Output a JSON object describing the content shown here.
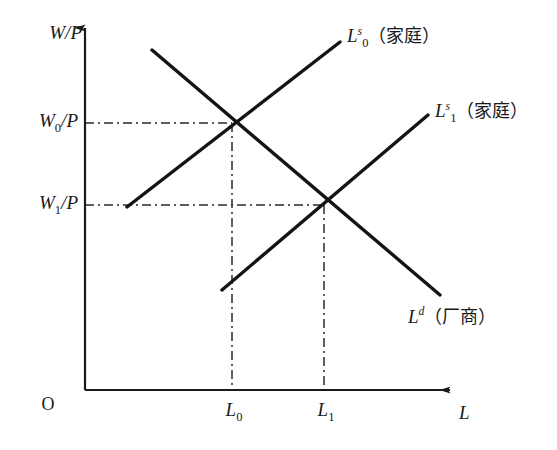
{
  "figure": {
    "type": "labor-market-supply-demand-diagram",
    "background_color": "#ffffff",
    "line_color": "#1a1a1a",
    "width": 557,
    "height": 450
  },
  "axes": {
    "y_label": "W/P",
    "x_label": "L",
    "origin_label": "O",
    "x_axis_y": 390,
    "y_axis_x": 85,
    "x_axis_end": 450,
    "y_axis_top": 28
  },
  "y_ticks": [
    {
      "id": "w0",
      "label_main": "W",
      "label_sub": "0",
      "label_rest": "/P",
      "value_y": 123
    },
    {
      "id": "w1",
      "label_main": "W",
      "label_sub": "1",
      "label_rest": "/P",
      "value_y": 205
    }
  ],
  "x_ticks": [
    {
      "id": "l0",
      "label_main": "L",
      "label_sub": "0",
      "value_x": 232
    },
    {
      "id": "l1",
      "label_main": "L",
      "label_sub": "1",
      "value_x": 324
    }
  ],
  "curves": [
    {
      "id": "labor-supply-0",
      "label_main": "L",
      "label_sup": "s",
      "label_sub": "0",
      "label_note": "（家庭）",
      "kind": "supply",
      "x1": 127,
      "y1": 207,
      "x2": 340,
      "y2": 42,
      "label_x": 347,
      "label_y": 38
    },
    {
      "id": "labor-supply-1",
      "label_main": "L",
      "label_sup": "s",
      "label_sub": "1",
      "label_note": "（家庭）",
      "kind": "supply",
      "x1": 222,
      "y1": 290,
      "x2": 428,
      "y2": 115,
      "label_x": 435,
      "label_y": 113
    },
    {
      "id": "labor-demand",
      "label_main": "L",
      "label_sup": "d",
      "label_sub": "",
      "label_note": "（厂商）",
      "kind": "demand",
      "x1": 152,
      "y1": 50,
      "x2": 440,
      "y2": 295,
      "label_x": 408,
      "label_y": 316
    }
  ],
  "equilibria": [
    {
      "id": "e0",
      "x": 232,
      "y": 123,
      "wage_tick": "w0",
      "labor_tick": "l0"
    },
    {
      "id": "e1",
      "x": 324,
      "y": 205,
      "wage_tick": "w1",
      "labor_tick": "l1"
    }
  ],
  "guides": [
    {
      "id": "guide-w0-horizontal",
      "orientation": "horizontal",
      "x1": 85,
      "y1": 123,
      "x2": 232,
      "y2": 123
    },
    {
      "id": "guide-l0-vertical",
      "orientation": "vertical",
      "x1": 232,
      "y1": 123,
      "x2": 232,
      "y2": 390
    },
    {
      "id": "guide-w1-horizontal",
      "orientation": "horizontal",
      "x1": 85,
      "y1": 205,
      "x2": 324,
      "y2": 205
    },
    {
      "id": "guide-l1-vertical",
      "orientation": "vertical",
      "x1": 324,
      "y1": 205,
      "x2": 324,
      "y2": 390
    }
  ]
}
